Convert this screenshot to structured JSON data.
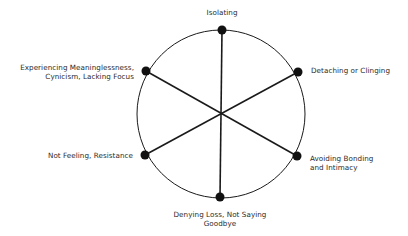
{
  "diagram": {
    "title": "",
    "circle": {
      "cx": 221,
      "cy": 114,
      "r": 84,
      "stroke": "#1a1a1a"
    },
    "center": {
      "x": 221,
      "y": 114
    },
    "node_color": "#111111",
    "nodes": [
      {
        "id": "isolating",
        "x": 222,
        "y": 30,
        "lines": [
          "Isolating"
        ]
      },
      {
        "id": "detaching",
        "x": 298,
        "y": 72,
        "lines": [
          "Detaching or Clinging"
        ]
      },
      {
        "id": "avoiding",
        "x": 297,
        "y": 156,
        "lines": [
          "Avoiding Bonding",
          "and Intimacy"
        ]
      },
      {
        "id": "denying",
        "x": 220,
        "y": 197,
        "lines": [
          "Denying Loss, Not Saying",
          "Goodbye"
        ]
      },
      {
        "id": "not-feeling",
        "x": 145,
        "y": 155,
        "lines": [
          "Not Feeling, Resistance"
        ]
      },
      {
        "id": "meaninglessness",
        "x": 146,
        "y": 71,
        "lines": [
          "Experiencing Meaninglessness,",
          "Cynicism, Lacking Focus"
        ]
      }
    ]
  }
}
